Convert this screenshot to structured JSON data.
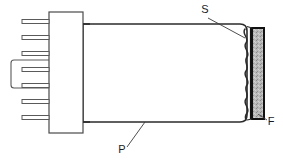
{
  "figure": {
    "type": "patent-line-drawing",
    "width": 283,
    "height": 161,
    "background_color": "#ffffff",
    "line_color": "#2b2b2b",
    "fill_color": "#ffffff",
    "filter_fill_color": "#b5b5b5",
    "filter_border_color": "#111111"
  },
  "labels": [
    {
      "id": "S",
      "text": "S",
      "meaning": "sealing-membrane",
      "x": 205,
      "y": 13
    },
    {
      "id": "F",
      "text": "F",
      "meaning": "filter-element",
      "x": 271,
      "y": 125
    },
    {
      "id": "P",
      "text": "P",
      "meaning": "housing-body",
      "x": 122,
      "y": 153
    }
  ],
  "parts": {
    "connector_block": {
      "name": "connector-block",
      "x": 49,
      "y": 12,
      "width": 34,
      "height": 121
    },
    "housing_body": {
      "name": "housing-body",
      "left": 83,
      "right": 247,
      "top": 24,
      "bottom": 122
    },
    "filter_element": {
      "name": "filter-element",
      "x": 252,
      "y": 28,
      "width": 12,
      "height": 91
    },
    "membrane": {
      "name": "wavy-membrane",
      "x": 246,
      "top": 29,
      "bottom": 120
    },
    "pins": {
      "name": "connector-pins",
      "count": 7,
      "x_start": 22,
      "x_end": 49,
      "y_positions": [
        22,
        38,
        54,
        70,
        86,
        102,
        118
      ]
    },
    "bracket": {
      "name": "pin-retaining-bracket",
      "x": 11,
      "y": 60,
      "width": 38,
      "height": 28
    }
  }
}
